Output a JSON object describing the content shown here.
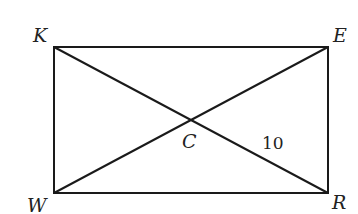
{
  "diagram": {
    "type": "rectangle-with-diagonals",
    "vertices": {
      "K": {
        "label": "K",
        "x": 54,
        "y": 47
      },
      "E": {
        "label": "E",
        "x": 328,
        "y": 47
      },
      "R": {
        "label": "R",
        "x": 328,
        "y": 193
      },
      "W": {
        "label": "W",
        "x": 54,
        "y": 193
      }
    },
    "intersection": {
      "label": "C",
      "x": 191,
      "y": 120
    },
    "segments": [
      "KE",
      "ER",
      "RW",
      "WK",
      "KR",
      "WE"
    ],
    "measurements": [
      {
        "segment": "CR",
        "value": "10"
      }
    ],
    "line_color": "#1a1a1a"
  }
}
